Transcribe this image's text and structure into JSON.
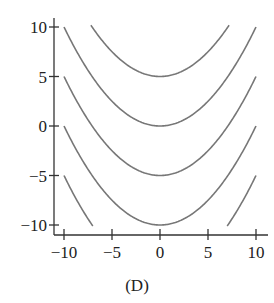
{
  "chart_data": {
    "type": "line",
    "title": "",
    "caption": "(D)",
    "xlabel": "",
    "ylabel": "",
    "xlim": [
      -10,
      10
    ],
    "ylim": [
      -10,
      10
    ],
    "x_ticks": [
      -10,
      -5,
      0,
      5,
      10
    ],
    "y_ticks": [
      -10,
      -5,
      0,
      5,
      10
    ],
    "x_tick_labels": [
      "−10",
      "−5",
      "0",
      "5",
      "10"
    ],
    "y_tick_labels": [
      "−10",
      "−5",
      "0",
      "5",
      "10"
    ],
    "grid": false,
    "legend": null,
    "series": [
      {
        "name": "C=5",
        "formula": "y = x^2/10 + 5",
        "vertex": [
          0,
          5
        ]
      },
      {
        "name": "C=0",
        "formula": "y = x^2/10",
        "vertex": [
          0,
          0
        ]
      },
      {
        "name": "C=-5",
        "formula": "y = x^2/10 - 5",
        "vertex": [
          0,
          -5
        ]
      },
      {
        "name": "C=-10",
        "formula": "y = x^2/10 - 10",
        "vertex": [
          0,
          -10
        ]
      },
      {
        "name": "C=-15",
        "formula": "y = x^2/10 - 15",
        "vertex": [
          0,
          -15
        ]
      }
    ],
    "line_color": "#777777",
    "axis_color": "#333333"
  }
}
